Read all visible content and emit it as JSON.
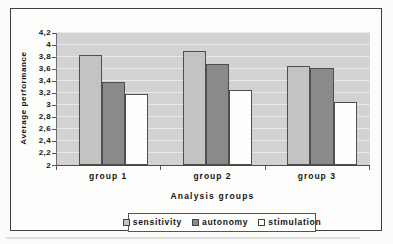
{
  "figure": {
    "frame_border_color": "#3f3f3f",
    "background": "#fdfdfc",
    "plot_background": "#d2d2d2",
    "gridline_color": "#e8e8e8",
    "bar_border_color": "#4f4f4f",
    "text_color": "#141414"
  },
  "chart_data": {
    "type": "bar",
    "title": "",
    "xlabel": "Analysis groups",
    "ylabel": "Average performance",
    "categories": [
      "group 1",
      "group 2",
      "group 3"
    ],
    "series": [
      {
        "name": "sensitivity",
        "color": "#c3c3c3",
        "values": [
          3.82,
          3.9,
          3.65
        ]
      },
      {
        "name": "autonomy",
        "color": "#8a8a8a",
        "values": [
          3.38,
          3.67,
          3.61
        ]
      },
      {
        "name": "stimulation",
        "color": "#fefefe",
        "values": [
          3.18,
          3.25,
          3.05
        ]
      }
    ],
    "ylim": [
      2,
      4.2
    ],
    "ytick_step": 0.2,
    "ytick_labels": [
      "2",
      "2,2",
      "2,4",
      "2,6",
      "2,8",
      "3",
      "3,2",
      "3,4",
      "3,6",
      "3,8",
      "4",
      "4,2"
    ],
    "decimal_separator": ",",
    "grid": true,
    "legend_position": "bottom"
  }
}
